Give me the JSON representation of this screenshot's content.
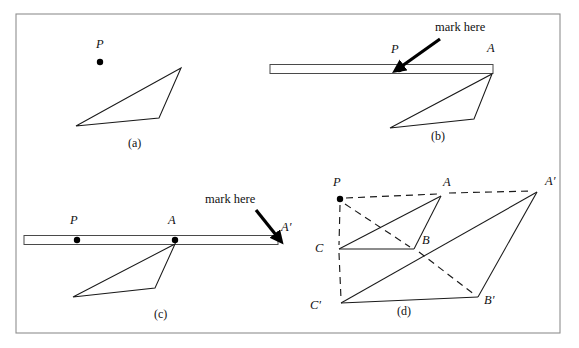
{
  "figure": {
    "frame": {
      "x": 16,
      "y": 14,
      "width": 544,
      "height": 319,
      "border_color": "#8f8f8f"
    },
    "colors": {
      "line": "#1a1a1a",
      "dash": "#1a1a1a",
      "ruler_stroke": "#4a4a4a",
      "dot": "#000000",
      "background": "#ffffff",
      "frame": "#8f8f8f"
    }
  },
  "panels": [
    {
      "id": "a",
      "caption": "(a)",
      "caption_pos": {
        "x": 128,
        "y": 147
      },
      "points": [
        {
          "name": "P",
          "label": "P",
          "label_pos": {
            "x": 96,
            "y": 48
          },
          "dot": {
            "x": 100,
            "y": 62
          },
          "dot_r": 3.2
        }
      ],
      "triangle": {
        "name": "triangle-abc",
        "vertices": [
          {
            "x": 181,
            "y": 68
          },
          {
            "x": 159,
            "y": 118
          },
          {
            "x": 76,
            "y": 126
          }
        ]
      }
    },
    {
      "id": "b",
      "caption": "(b)",
      "caption_pos": {
        "x": 431,
        "y": 140
      },
      "ruler": {
        "x": 270,
        "y": 64.5,
        "width": 223,
        "height": 9
      },
      "points": [
        {
          "name": "P",
          "label": "P",
          "label_pos": {
            "x": 391,
            "y": 53
          },
          "dot": {
            "x": 399,
            "y": 69
          },
          "dot_r": 3.2
        },
        {
          "name": "A",
          "label": "A",
          "label_pos": {
            "x": 487,
            "y": 52
          },
          "dot": null,
          "dot_r": 0
        }
      ],
      "triangle": {
        "name": "triangle-abc",
        "vertices": [
          {
            "x": 492,
            "y": 74
          },
          {
            "x": 474,
            "y": 119
          },
          {
            "x": 390,
            "y": 128
          }
        ]
      },
      "callout": {
        "text": "mark here",
        "text_pos": {
          "x": 435,
          "y": 31
        },
        "arrow_from": {
          "x": 440,
          "y": 39
        },
        "arrow_to": {
          "x": 402,
          "y": 66
        }
      }
    },
    {
      "id": "c",
      "caption": "(c)",
      "caption_pos": {
        "x": 154,
        "y": 318
      },
      "ruler": {
        "x": 24,
        "y": 235.5,
        "width": 254,
        "height": 9
      },
      "points": [
        {
          "name": "P",
          "label": "P",
          "label_pos": {
            "x": 70,
            "y": 224
          },
          "dot": {
            "x": 77,
            "y": 240
          },
          "dot_r": 3.2
        },
        {
          "name": "A",
          "label": "A",
          "label_pos": {
            "x": 168,
            "y": 224
          },
          "dot": {
            "x": 175,
            "y": 240
          },
          "dot_r": 3.2
        },
        {
          "name": "A'",
          "label": "A′",
          "label_pos": {
            "x": 281,
            "y": 231
          },
          "dot": null,
          "dot_r": 0
        }
      ],
      "triangle": {
        "name": "triangle-abc",
        "vertices": [
          {
            "x": 175,
            "y": 244
          },
          {
            "x": 155,
            "y": 288
          },
          {
            "x": 73,
            "y": 297
          }
        ]
      },
      "callout": {
        "text": "mark here",
        "text_pos": {
          "x": 205,
          "y": 203
        },
        "arrow_from": {
          "x": 256,
          "y": 210
        },
        "arrow_to": {
          "x": 276,
          "y": 235
        }
      }
    },
    {
      "id": "d",
      "caption": "(d)",
      "caption_pos": {
        "x": 397,
        "y": 315
      },
      "points": [
        {
          "name": "P",
          "label": "P",
          "label_pos": {
            "x": 333,
            "y": 186
          },
          "dot": {
            "x": 340,
            "y": 199
          },
          "dot_r": 3.2
        },
        {
          "name": "A",
          "label": "A",
          "label_pos": {
            "x": 443,
            "y": 186
          },
          "dot": null,
          "dot_r": 0
        },
        {
          "name": "A'",
          "label": "A′",
          "label_pos": {
            "x": 545,
            "y": 185
          },
          "dot": null,
          "dot_r": 0
        },
        {
          "name": "B",
          "label": "B",
          "label_pos": {
            "x": 422,
            "y": 244
          },
          "dot": null,
          "dot_r": 0
        },
        {
          "name": "B'",
          "label": "B′",
          "label_pos": {
            "x": 484,
            "y": 304
          },
          "dot": null,
          "dot_r": 0
        },
        {
          "name": "C",
          "label": "C",
          "label_pos": {
            "x": 315,
            "y": 252
          },
          "dot": null,
          "dot_r": 0
        },
        {
          "name": "C'",
          "label": "C′",
          "label_pos": {
            "x": 310,
            "y": 309
          },
          "dot": null,
          "dot_r": 0
        }
      ],
      "vertices": {
        "A": {
          "x": 441,
          "y": 196
        },
        "Ap": {
          "x": 537,
          "y": 192
        },
        "B": {
          "x": 414,
          "y": 249
        },
        "Bp": {
          "x": 478,
          "y": 297
        },
        "C": {
          "x": 339,
          "y": 249
        },
        "Cp": {
          "x": 341,
          "y": 303
        }
      },
      "solid_edges": [
        {
          "name": "edge-C-A",
          "from": "C",
          "to": "A"
        },
        {
          "name": "edge-A-B",
          "from": "A",
          "to": "B"
        },
        {
          "name": "edge-B-C",
          "from": "B",
          "to": "C"
        },
        {
          "name": "edge-Cp-Ap",
          "from": "Cp",
          "to": "Ap"
        },
        {
          "name": "edge-Ap-Bp",
          "from": "Ap",
          "to": "Bp"
        },
        {
          "name": "edge-Bp-Cp",
          "from": "Bp",
          "to": "Cp"
        }
      ],
      "dashed_edges": [
        {
          "name": "dash-P-A",
          "from": {
            "x": 346,
            "y": 198
          },
          "to": {
            "x": 437,
            "y": 194
          }
        },
        {
          "name": "dash-A-Ap",
          "from": {
            "x": 449,
            "y": 193
          },
          "to": {
            "x": 533,
            "y": 191
          }
        },
        {
          "name": "dash-P-B",
          "from": {
            "x": 345,
            "y": 204
          },
          "to": {
            "x": 410,
            "y": 247
          }
        },
        {
          "name": "dash-B-Bp",
          "from": {
            "x": 419,
            "y": 252
          },
          "to": {
            "x": 475,
            "y": 295
          }
        },
        {
          "name": "dash-P-C",
          "from": {
            "x": 340,
            "y": 205
          },
          "to": {
            "x": 339,
            "y": 245
          }
        },
        {
          "name": "dash-C-Cp",
          "from": {
            "x": 339,
            "y": 253
          },
          "to": {
            "x": 341,
            "y": 299
          }
        }
      ]
    }
  ]
}
